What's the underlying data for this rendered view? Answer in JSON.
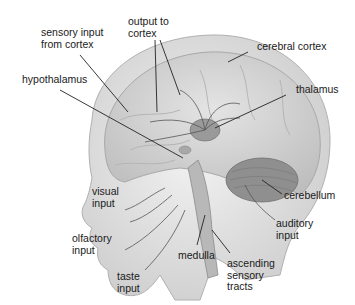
{
  "figure": {
    "labels": {
      "sensory_input_from_cortex": "sensory input\nfrom cortex",
      "output_to_cortex": "output to\ncortex",
      "cerebral_cortex": "cerebral cortex",
      "hypothalamus": "hypothalamus",
      "thalamus": "thalamus",
      "visual_input": "visual\ninput",
      "cerebellum": "cerebellum",
      "olfactory_input": "olfactory\ninput",
      "auditory_input": "auditory\ninput",
      "medulla": "medulla",
      "taste_input": "taste\ninput",
      "ascending_sensory_tracts": "ascending\nsensory\ntracts"
    },
    "colors": {
      "skin": "#e2e2e2",
      "brain": "#d2d2d2",
      "thalamus": "#9a9a9a",
      "cerebellum": "#8c8c8c",
      "line": "#222222"
    }
  }
}
